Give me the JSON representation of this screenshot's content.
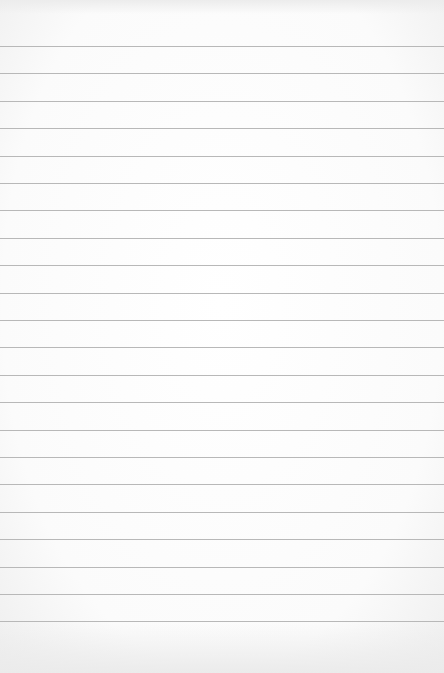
{
  "paper": {
    "type": "lined-paper",
    "background_color": "#fdfdfd",
    "rule_color": "#b8b8b8",
    "rule_count": 22,
    "first_rule_y": 46,
    "rule_spacing": 27.4
  }
}
